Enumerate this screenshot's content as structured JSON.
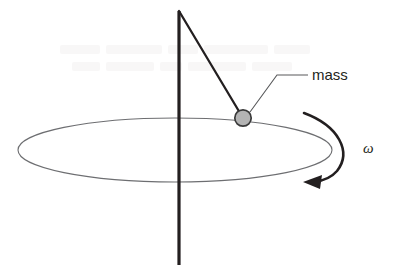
{
  "figure": {
    "background_color": "#ffffff",
    "width": 394,
    "height": 278
  },
  "labels": {
    "mass": "mass",
    "angular_velocity": "ω"
  },
  "colors": {
    "axis_line": "#231f20",
    "string_line": "#231f20",
    "orbit_ellipse": "#6d6e71",
    "mass_fill": "#b3b3b3",
    "mass_stroke": "#3a3a3a",
    "leader_line": "#58595b",
    "rotation_arrow": "#231f20",
    "text": "#231f20"
  },
  "geometry": {
    "axis": {
      "x": 179,
      "y_top": 11,
      "y_bottom": 265,
      "stroke_width": 3.2
    },
    "orbit": {
      "cx": 175,
      "cy": 150,
      "rx": 157,
      "ry": 32,
      "stroke_width": 1.1
    },
    "string": {
      "x1": 179,
      "y1": 11,
      "x2": 243,
      "y2": 118,
      "stroke_width": 2.2
    },
    "mass": {
      "cx": 243,
      "cy": 118,
      "r": 8.2,
      "stroke_width": 1.6
    },
    "leader": {
      "x1": 250,
      "y1": 111,
      "x2": 277,
      "y2": 75,
      "x3": 308,
      "y3": 75,
      "stroke_width": 1.1
    },
    "mass_label": {
      "x": 312,
      "y": 80
    },
    "omega_label": {
      "x": 363,
      "y": 153
    },
    "rotation_arrow": {
      "arrowhead_x": 308,
      "arrowhead_y": 182
    }
  }
}
